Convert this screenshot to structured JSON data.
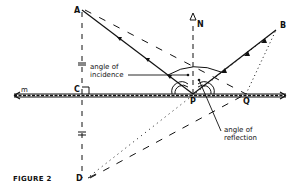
{
  "figure": {
    "caption": "FIGURE 2",
    "points": {
      "A": "A",
      "B": "B",
      "C": "C",
      "D": "D",
      "P": "P",
      "Q": "Q",
      "N": "N",
      "m": "m"
    },
    "annotations": {
      "incidence_line1": "angle of",
      "incidence_line2": "incidence",
      "reflection_line1": "angle of",
      "reflection_line2": "reflection"
    },
    "colors": {
      "ink": "#111111",
      "background": "#ffffff"
    }
  }
}
